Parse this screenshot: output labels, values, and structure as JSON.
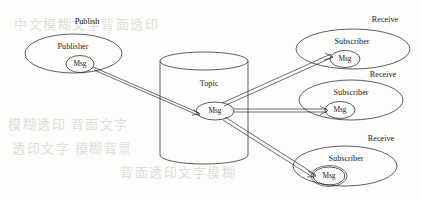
{
  "diagram": {
    "type": "pub-sub-flow",
    "background_color": "#fdfdfb",
    "line_color": "#2a2a2a",
    "text_color": "#1c1c1c",
    "bleed_text_color": "#c9c6c0"
  },
  "labels": {
    "publish": "Publish",
    "topic": "Topic",
    "publisher": "Publisher",
    "subscriber": "Subscriber",
    "msg": "Msg",
    "receive": "Receive"
  },
  "nodes": {
    "publisher": {
      "label": "Publisher",
      "caption": "Publish",
      "msg": "Msg",
      "cx": 73.5,
      "cy": 53.5,
      "rx": 48.5,
      "ry": 19.5,
      "caption_x": 87,
      "caption_y": 22,
      "label_x": 73,
      "label_y": 47,
      "msg_cx": 80,
      "msg_cy": 64,
      "msg_rx": 14,
      "msg_ry": 8.5
    },
    "topic": {
      "label": "Topic",
      "msg": "Msg",
      "cx": 204,
      "top_y": 61,
      "bottom_y": 155,
      "rx": 44,
      "ry": 9,
      "label_x": 209,
      "label_y": 84,
      "msg_cx": 215,
      "msg_cy": 111,
      "msg_rx": 19,
      "msg_ry": 9
    },
    "subscribers": [
      {
        "label": "Subscriber",
        "caption": "Receive",
        "msg": "Msg",
        "cx": 353,
        "cy": 49,
        "rx": 57,
        "ry": 20,
        "caption_x": 385,
        "caption_y": 20,
        "label_x": 352,
        "label_y": 42,
        "msg_cx": 345,
        "msg_cy": 59,
        "msg_rx": 15,
        "msg_ry": 8.5
      },
      {
        "label": "Subscriber",
        "caption": "Receive",
        "msg": "Msg",
        "cx": 351,
        "cy": 100,
        "rx": 52,
        "ry": 20,
        "caption_x": 383,
        "caption_y": 75,
        "label_x": 351,
        "label_y": 93,
        "msg_cx": 340,
        "msg_cy": 110,
        "msg_rx": 15,
        "msg_ry": 8.5
      },
      {
        "label": "Subscriber",
        "caption": "Receive",
        "msg": "Msg",
        "cx": 345,
        "cy": 166,
        "rx": 52,
        "ry": 20,
        "caption_x": 381,
        "caption_y": 139,
        "label_x": 346,
        "label_y": 159,
        "msg_cx": 329,
        "msg_cy": 176,
        "msg_rx": 16,
        "msg_ry": 9
      }
    ]
  },
  "connections": [
    {
      "name": "publisher-to-topic",
      "from": "publisher.msg",
      "to": "topic.msg",
      "style": "double-line-arrow"
    },
    {
      "name": "topic-to-subscriber-1",
      "from": "topic.msg",
      "to": "subscriber-1.msg",
      "style": "double-line-arrow"
    },
    {
      "name": "topic-to-subscriber-2",
      "from": "topic.msg",
      "to": "subscriber-2.msg",
      "style": "double-line-arrow"
    },
    {
      "name": "topic-to-subscriber-3",
      "from": "topic.msg",
      "to": "subscriber-3.msg",
      "style": "double-line-arrow"
    }
  ],
  "bleed_through": [
    {
      "text": "中文模糊文字背面透印",
      "x": 14,
      "y": 22,
      "size": 13
    },
    {
      "text": "模糊透印 背面文字",
      "x": 8,
      "y": 122,
      "size": 13
    },
    {
      "text": "透印文字 模糊背景",
      "x": 12,
      "y": 146,
      "size": 13
    },
    {
      "text": "背面透印文字模糊",
      "x": 120,
      "y": 170,
      "size": 13
    }
  ]
}
